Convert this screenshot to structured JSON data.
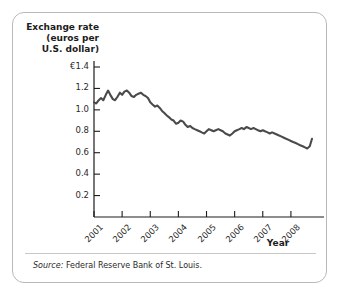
{
  "figure": {
    "y_axis_title": "Exchange rate\n(euros per\nU.S. dollar)",
    "x_axis_title": "Year",
    "source_lead": "Source:",
    "source_text": " Federal Reserve Bank of St. Louis.",
    "line_color": "#4a4a4a",
    "axis_color": "#1c1c1c",
    "border_color": "#b9b9b9",
    "background": "#ffffff"
  },
  "chart_data": {
    "type": "line",
    "title": "",
    "subtitle": "",
    "xlabel": "Year",
    "ylabel": "Exchange rate (euros per U.S. dollar)",
    "ylim": [
      0,
      1.4
    ],
    "xlim": [
      2001.0,
      2008.75
    ],
    "grid": false,
    "legend": false,
    "ytick_labels": [
      "€1.4",
      "1.2",
      "1.0",
      "0.8",
      "0.6",
      "0.4",
      "0.2"
    ],
    "ytick_values": [
      1.4,
      1.2,
      1.0,
      0.8,
      0.6,
      0.4,
      0.2
    ],
    "xtick_labels": [
      "2001",
      "2002",
      "2003",
      "2004",
      "2005",
      "2006",
      "2007",
      "2008"
    ],
    "xtick_values": [
      2001,
      2002,
      2003,
      2004,
      2005,
      2006,
      2007,
      2008
    ],
    "series": [
      {
        "name": "Euros per U.S. dollar",
        "x": [
          2001.0,
          2001.08,
          2001.17,
          2001.25,
          2001.33,
          2001.42,
          2001.5,
          2001.58,
          2001.67,
          2001.75,
          2001.83,
          2001.92,
          2002.0,
          2002.08,
          2002.17,
          2002.25,
          2002.33,
          2002.42,
          2002.5,
          2002.58,
          2002.67,
          2002.75,
          2002.83,
          2002.92,
          2003.0,
          2003.08,
          2003.17,
          2003.25,
          2003.33,
          2003.42,
          2003.5,
          2003.58,
          2003.67,
          2003.75,
          2003.83,
          2003.92,
          2004.0,
          2004.08,
          2004.17,
          2004.25,
          2004.33,
          2004.42,
          2004.5,
          2004.58,
          2004.67,
          2004.75,
          2004.83,
          2004.92,
          2005.0,
          2005.08,
          2005.17,
          2005.25,
          2005.33,
          2005.42,
          2005.5,
          2005.58,
          2005.67,
          2005.75,
          2005.83,
          2005.92,
          2006.0,
          2006.08,
          2006.17,
          2006.25,
          2006.33,
          2006.42,
          2006.5,
          2006.58,
          2006.67,
          2006.75,
          2006.83,
          2006.92,
          2007.0,
          2007.08,
          2007.17,
          2007.25,
          2007.33,
          2007.42,
          2007.5,
          2007.58,
          2007.67,
          2007.75,
          2007.83,
          2007.92,
          2008.0,
          2008.08,
          2008.17,
          2008.25,
          2008.33,
          2008.42,
          2008.5,
          2008.58,
          2008.67,
          2008.75
        ],
        "values": [
          1.07,
          1.06,
          1.09,
          1.11,
          1.09,
          1.14,
          1.18,
          1.14,
          1.1,
          1.09,
          1.12,
          1.16,
          1.14,
          1.17,
          1.18,
          1.16,
          1.13,
          1.12,
          1.14,
          1.15,
          1.16,
          1.14,
          1.13,
          1.11,
          1.07,
          1.05,
          1.03,
          1.04,
          1.02,
          0.99,
          0.97,
          0.95,
          0.93,
          0.91,
          0.9,
          0.87,
          0.88,
          0.9,
          0.89,
          0.86,
          0.84,
          0.85,
          0.83,
          0.82,
          0.81,
          0.8,
          0.79,
          0.78,
          0.8,
          0.82,
          0.81,
          0.8,
          0.81,
          0.82,
          0.81,
          0.8,
          0.78,
          0.77,
          0.76,
          0.78,
          0.8,
          0.81,
          0.82,
          0.83,
          0.82,
          0.84,
          0.83,
          0.82,
          0.83,
          0.82,
          0.81,
          0.8,
          0.81,
          0.8,
          0.79,
          0.78,
          0.79,
          0.78,
          0.77,
          0.76,
          0.75,
          0.74,
          0.73,
          0.72,
          0.71,
          0.7,
          0.69,
          0.68,
          0.67,
          0.66,
          0.65,
          0.64,
          0.66,
          0.73
        ]
      }
    ]
  }
}
